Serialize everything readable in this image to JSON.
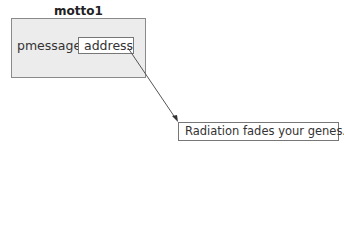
{
  "diagram": {
    "struct": {
      "name": "motto1",
      "member_name": "pmessage",
      "member_value": "address"
    },
    "pointee": {
      "text": "Radiation fades your genes."
    },
    "arrow": {
      "from": "address",
      "to": "Radiation fades your genes."
    }
  }
}
